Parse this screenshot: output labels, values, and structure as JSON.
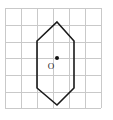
{
  "figure": {
    "type": "geometry-diagram",
    "canvas": {
      "width": 113,
      "height": 120,
      "background": "#ffffff"
    },
    "grid": {
      "color": "#c9c9c9",
      "faint_color": "#dedede",
      "spacing": 16,
      "x_lines": [
        5,
        21,
        37,
        53,
        69,
        85,
        101
      ],
      "y_lines": [
        8,
        25,
        42,
        58,
        75,
        92,
        108
      ],
      "columns": 6,
      "rows": 6
    },
    "shapes": [
      {
        "name": "hexagon",
        "kind": "polygon",
        "stroke": "#1a1a1a",
        "fill": "none",
        "points": "57,22 74,41 74,88 57,105 37,88 37,41",
        "vertices": [
          {
            "label": "top",
            "x": 57,
            "y": 22
          },
          {
            "label": "upper-right",
            "x": 74,
            "y": 41
          },
          {
            "label": "lower-right",
            "x": 74,
            "y": 88
          },
          {
            "label": "bottom",
            "x": 57,
            "y": 105
          },
          {
            "label": "lower-left",
            "x": 37,
            "y": 88
          },
          {
            "label": "upper-left",
            "x": 37,
            "y": 41
          }
        ]
      }
    ],
    "points": [
      {
        "name": "center-point",
        "label": "O",
        "x": 57,
        "y": 58,
        "radius": 2,
        "color": "#111111",
        "label_x": 51,
        "label_y": 67
      }
    ]
  }
}
